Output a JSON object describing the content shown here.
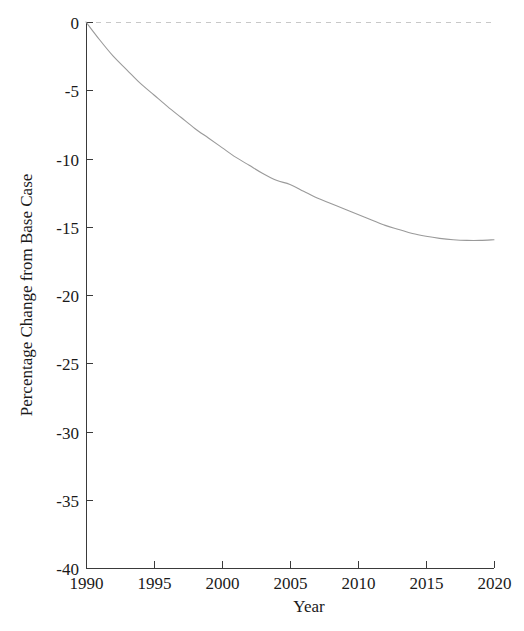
{
  "chart_data": {
    "type": "line",
    "title": "",
    "subtitle": "",
    "xlabel": "Year",
    "ylabel": "Percentage Change from Base Case",
    "xlim": [
      1990,
      2020
    ],
    "ylim": [
      -40,
      0
    ],
    "grid": false,
    "legend": null,
    "legend_position": "none",
    "x_ticks": [
      1990,
      1995,
      2000,
      2005,
      2010,
      2015,
      2020
    ],
    "x_tick_labels": [
      "1990",
      "1995",
      "2000",
      "2005",
      "2010",
      "2015",
      "2020"
    ],
    "y_ticks": [
      0,
      -5,
      -10,
      -15,
      -20,
      -25,
      -30,
      -35,
      -40
    ],
    "y_tick_labels": [
      "0",
      "-5",
      "-10",
      "-15",
      "-20",
      "-25",
      "-30",
      "-35",
      "-40"
    ],
    "annotations": [
      {
        "name": "zero-reference-line",
        "kind": "hline",
        "value": 0,
        "style": "dashed",
        "color": "#c8c8c8"
      }
    ],
    "series": [
      {
        "name": "Percentage Change from Base Case",
        "color": "#9a9a9a",
        "style": "solid",
        "x": [
          1990,
          1991,
          1992,
          1993,
          1994,
          1995,
          1996,
          1997,
          1998,
          1999,
          2000,
          2001,
          2002,
          2003,
          2004,
          2005,
          2006,
          2007,
          2008,
          2009,
          2010,
          2011,
          2012,
          2013,
          2014,
          2015,
          2016,
          2017,
          2018,
          2019,
          2020
        ],
        "values": [
          0.0,
          -1.3,
          -2.5,
          -3.5,
          -4.5,
          -5.35,
          -6.2,
          -7.0,
          -7.8,
          -8.5,
          -9.2,
          -9.9,
          -10.5,
          -11.1,
          -11.6,
          -11.9,
          -12.4,
          -12.9,
          -13.3,
          -13.7,
          -14.1,
          -14.5,
          -14.9,
          -15.2,
          -15.5,
          -15.7,
          -15.85,
          -15.95,
          -16.0,
          -16.0,
          -15.95
        ]
      }
    ]
  },
  "axes": {
    "x_axis_name": "year-axis",
    "y_axis_name": "percentage-change-axis"
  }
}
